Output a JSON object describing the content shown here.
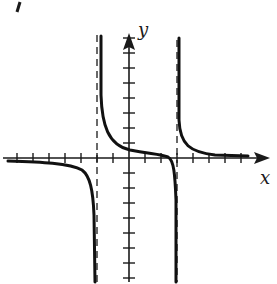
{
  "chart_data": {
    "type": "line",
    "title": "",
    "xlabel": "x",
    "ylabel": "y",
    "grid": false,
    "axes": {
      "x_axis": {
        "label": "x",
        "arrow": "right",
        "ticks_left": 7,
        "ticks_right": 7
      },
      "y_axis": {
        "label": "y",
        "arrow": "up",
        "ticks_up": 8,
        "ticks_down": 8
      }
    },
    "vertical_asymptotes": [
      -2,
      3
    ],
    "horizontal_asymptote": 0,
    "branches": [
      {
        "name": "left",
        "x_range": [
          -8,
          -2
        ],
        "behavior": "approaches 0 from below as x→-∞, → -∞ as x→-2⁻"
      },
      {
        "name": "middle",
        "x_range": [
          -2,
          3
        ],
        "behavior": "→ +∞ as x→-2⁺, decreases through near origin, → -∞ as x→3⁻"
      },
      {
        "name": "right",
        "x_range": [
          3,
          8
        ],
        "behavior": "→ +∞ as x→3⁺, approaches 0 from above as x→+∞"
      }
    ]
  },
  "labels": {
    "x": "x",
    "y": "y"
  },
  "colors": {
    "ink": "#1a1a1a",
    "background": "#ffffff"
  }
}
